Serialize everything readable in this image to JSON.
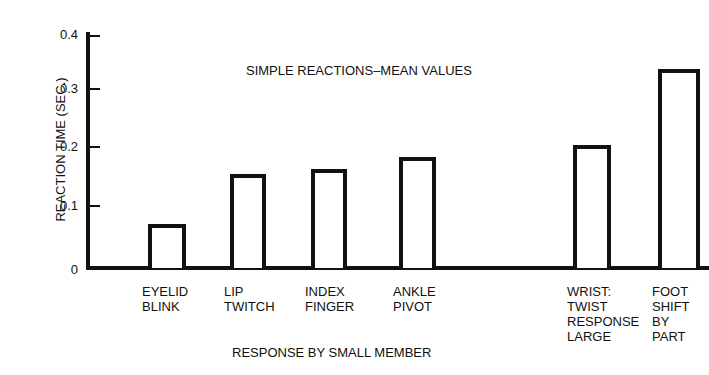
{
  "chart_data": {
    "type": "bar",
    "title": "SIMPLE REACTIONS–MEAN VALUES",
    "xlabel": "RESPONSE BY SMALL MEMBER",
    "ylabel": "REACTION TIME (SEC.)",
    "ylim": [
      0,
      0.4
    ],
    "yticks": [
      "0",
      "0.1",
      "0.2",
      "0.3",
      "0.4"
    ],
    "grid": false,
    "categories": [
      "EYELID\nBLINK",
      "LIP\nTWITCH",
      "INDEX\nFINGER",
      "ANKLE\nPIVOT",
      "WRIST:\nTWIST\nRESPONSE\nLARGE",
      "FOOT\nSHIFT\nBY\nPART"
    ],
    "values": [
      0.075,
      0.16,
      0.17,
      0.19,
      0.21,
      0.34
    ]
  }
}
